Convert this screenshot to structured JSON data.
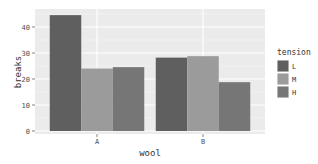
{
  "chart_data": {
    "type": "bar",
    "title": "",
    "xlabel": "wool",
    "ylabel": "breaks",
    "categories": [
      "A",
      "B"
    ],
    "series": [
      {
        "name": "L",
        "values": [
          44.56,
          28.22
        ],
        "color": "#5f5f5f"
      },
      {
        "name": "M",
        "values": [
          24.0,
          28.78
        ],
        "color": "#9b9b9b"
      },
      {
        "name": "H",
        "values": [
          24.56,
          18.78
        ],
        "color": "#767676"
      }
    ],
    "yticks": [
      0,
      10,
      20,
      30,
      40
    ],
    "ylim": [
      0,
      46.8
    ],
    "grid": true,
    "legend": {
      "title": "tension",
      "position": "right",
      "labels": [
        "L",
        "M",
        "H"
      ]
    }
  }
}
